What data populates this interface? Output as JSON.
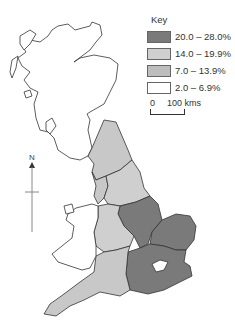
{
  "map": {
    "title": "UK regional map",
    "colors": {
      "class1": "#7a7a7a",
      "class2": "#c8c8c8",
      "class3": "#bdbdbd",
      "class4": "#ffffff",
      "outline": "#333333"
    }
  },
  "legend": {
    "title": "Key",
    "items": [
      {
        "label": "20.0 – 28.0%",
        "color": "#7a7a7a"
      },
      {
        "label": "14.0 – 19.9%",
        "color": "#cfcfcf"
      },
      {
        "label": "7.0 – 13.9%",
        "color": "#bdbdbd"
      },
      {
        "label": "2.0 – 6.9%",
        "color": "#ffffff"
      }
    ]
  },
  "scale": {
    "start": "0",
    "end": "100 kms"
  },
  "north": {
    "label": "N"
  }
}
